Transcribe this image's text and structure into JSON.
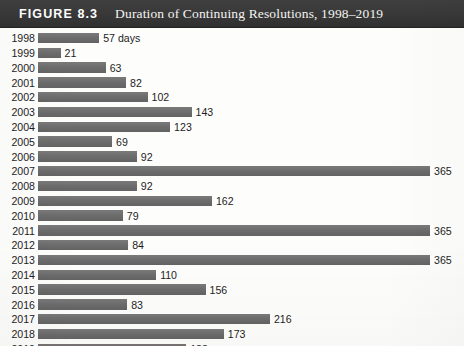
{
  "figure": {
    "label": "FIGURE 8.3",
    "title": "Duration of Continuing Resolutions, 1998–2019"
  },
  "colors": {
    "header_background": "#3b3b3b",
    "header_text": "#ffffff",
    "bar_fill": "#6f6f6f",
    "page_background": "#fdfdfc",
    "text": "#1d1d1d"
  },
  "chart_data": {
    "type": "bar",
    "orientation": "horizontal",
    "title": "Duration of Continuing Resolutions, 1998–2019",
    "xlabel": "",
    "ylabel": "",
    "unit": "days",
    "xlim": [
      0,
      365
    ],
    "grid": false,
    "legend": false,
    "categories": [
      "1998",
      "1999",
      "2000",
      "2001",
      "2002",
      "2003",
      "2004",
      "2005",
      "2006",
      "2007",
      "2008",
      "2009",
      "2010",
      "2011",
      "2012",
      "2013",
      "2014",
      "2015",
      "2016",
      "2017",
      "2018",
      "2019"
    ],
    "values": [
      57,
      21,
      63,
      82,
      102,
      143,
      123,
      69,
      92,
      365,
      92,
      162,
      79,
      365,
      84,
      365,
      110,
      156,
      83,
      216,
      173,
      138
    ],
    "value_labels": [
      "57 days",
      "21",
      "63",
      "82",
      "102",
      "143",
      "123",
      "69",
      "92",
      "365",
      "92",
      "162",
      "79",
      "365",
      "84",
      "365",
      "110",
      "156",
      "83",
      "216",
      "173",
      "138"
    ]
  }
}
